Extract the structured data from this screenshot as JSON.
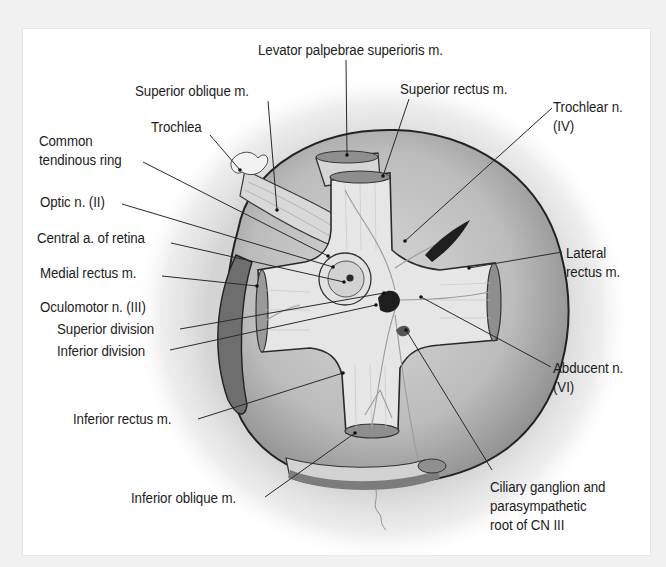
{
  "diagram": {
    "colors": {
      "frame_bg": "#f1f1f1",
      "panel_bg": "#ffffff",
      "text": "#1c1c1c",
      "leader": "#2a2a2a",
      "globe_fill": "#b9b9b9",
      "muscle_fill": "#e4e4e4",
      "muscle_cut": "#8f8f8f"
    },
    "labels": [
      {
        "id": "levator-palpebrae",
        "text": "Levator palpebrae superioris m.",
        "x": 258,
        "y": 40
      },
      {
        "id": "superior-oblique",
        "text": "Superior oblique m.",
        "x": 135,
        "y": 81
      },
      {
        "id": "superior-rectus",
        "text": "Superior rectus m.",
        "x": 400,
        "y": 79
      },
      {
        "id": "trochlear-n",
        "text": "Trochlear n.\n(IV)",
        "x": 553,
        "y": 97
      },
      {
        "id": "trochlea",
        "text": "Trochlea",
        "x": 151,
        "y": 117
      },
      {
        "id": "common-tendinous-ring",
        "text": "Common\ntendinous ring",
        "x": 39,
        "y": 131
      },
      {
        "id": "optic-n",
        "text": "Optic n. (II)",
        "x": 40,
        "y": 192
      },
      {
        "id": "central-a-retina",
        "text": "Central a. of retina",
        "x": 37,
        "y": 228
      },
      {
        "id": "lateral-rectus",
        "text": "Lateral\nrectus m.",
        "x": 566,
        "y": 243
      },
      {
        "id": "medial-rectus",
        "text": "Medial rectus m.",
        "x": 40,
        "y": 263
      },
      {
        "id": "oculomotor-n",
        "text": "Oculomotor n. (III)",
        "x": 40,
        "y": 297
      },
      {
        "id": "superior-division",
        "text": "Superior division",
        "x": 57,
        "y": 319
      },
      {
        "id": "inferior-division",
        "text": "Inferior division",
        "x": 57,
        "y": 341
      },
      {
        "id": "abducent-n",
        "text": "Abducent n.\n(VI)",
        "x": 553,
        "y": 358
      },
      {
        "id": "inferior-rectus",
        "text": "Inferior rectus m.",
        "x": 73,
        "y": 409
      },
      {
        "id": "inferior-oblique",
        "text": "Inferior oblique m.",
        "x": 131,
        "y": 488
      },
      {
        "id": "ciliary-ganglion",
        "text": "Ciliary ganglion and\nparasympathetic\nroot of CN III",
        "x": 490,
        "y": 477
      }
    ]
  }
}
